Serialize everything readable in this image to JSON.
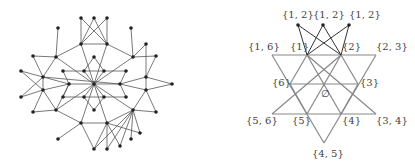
{
  "left_graph": {
    "nodes": [
      [
        81,
        18
      ],
      [
        94,
        18
      ],
      [
        107,
        18
      ],
      [
        58,
        28
      ],
      [
        131,
        28
      ],
      [
        81,
        44
      ],
      [
        107,
        44
      ],
      [
        146,
        44
      ],
      [
        33,
        56
      ],
      [
        56,
        57
      ],
      [
        94,
        57
      ],
      [
        133,
        57
      ],
      [
        156,
        56
      ],
      [
        21,
        71
      ],
      [
        63,
        71
      ],
      [
        84,
        71
      ],
      [
        104,
        71
      ],
      [
        126,
        71
      ],
      [
        43,
        77
      ],
      [
        146,
        77
      ],
      [
        69,
        84
      ],
      [
        94,
        84
      ],
      [
        120,
        84
      ],
      [
        172,
        84
      ],
      [
        43,
        90
      ],
      [
        146,
        90
      ],
      [
        21,
        97
      ],
      [
        63,
        97
      ],
      [
        84,
        97
      ],
      [
        104,
        97
      ],
      [
        126,
        97
      ],
      [
        94,
        110
      ],
      [
        33,
        112
      ],
      [
        56,
        110
      ],
      [
        133,
        110
      ],
      [
        156,
        112
      ],
      [
        81,
        123
      ],
      [
        107,
        123
      ],
      [
        140,
        133
      ],
      [
        58,
        139
      ],
      [
        131,
        139
      ],
      [
        94,
        149
      ],
      [
        107,
        149
      ],
      [
        120,
        146
      ]
    ],
    "edges": [
      [
        0,
        5
      ],
      [
        0,
        6
      ],
      [
        1,
        5
      ],
      [
        1,
        6
      ],
      [
        2,
        5
      ],
      [
        2,
        6
      ],
      [
        3,
        9
      ],
      [
        4,
        11
      ],
      [
        5,
        6
      ],
      [
        5,
        9
      ],
      [
        6,
        11
      ],
      [
        7,
        11
      ],
      [
        7,
        19
      ],
      [
        11,
        12
      ],
      [
        12,
        19
      ],
      [
        8,
        9
      ],
      [
        8,
        18
      ],
      [
        9,
        18
      ],
      [
        9,
        21
      ],
      [
        5,
        21
      ],
      [
        6,
        21
      ],
      [
        11,
        21
      ],
      [
        13,
        18
      ],
      [
        13,
        24
      ],
      [
        18,
        24
      ],
      [
        18,
        20
      ],
      [
        18,
        22
      ],
      [
        14,
        15
      ],
      [
        15,
        16
      ],
      [
        16,
        17
      ],
      [
        10,
        15
      ],
      [
        10,
        16
      ],
      [
        14,
        20
      ],
      [
        17,
        22
      ],
      [
        20,
        21
      ],
      [
        21,
        22
      ],
      [
        15,
        21
      ],
      [
        16,
        21
      ],
      [
        28,
        21
      ],
      [
        29,
        21
      ],
      [
        19,
        22
      ],
      [
        19,
        23
      ],
      [
        23,
        25
      ],
      [
        19,
        25
      ],
      [
        22,
        25
      ],
      [
        24,
        20
      ],
      [
        24,
        33
      ],
      [
        24,
        32
      ],
      [
        26,
        24
      ],
      [
        26,
        18
      ],
      [
        27,
        28
      ],
      [
        28,
        29
      ],
      [
        29,
        30
      ],
      [
        27,
        20
      ],
      [
        30,
        22
      ],
      [
        31,
        28
      ],
      [
        31,
        29
      ],
      [
        33,
        36
      ],
      [
        33,
        21
      ],
      [
        36,
        37
      ],
      [
        37,
        34
      ],
      [
        34,
        21
      ],
      [
        34,
        25
      ],
      [
        34,
        35
      ],
      [
        25,
        35
      ],
      [
        36,
        39
      ],
      [
        36,
        41
      ],
      [
        37,
        41
      ],
      [
        37,
        42
      ],
      [
        37,
        43
      ],
      [
        37,
        38
      ],
      [
        34,
        38
      ],
      [
        34,
        40
      ],
      [
        34,
        42
      ],
      [
        34,
        41
      ],
      [
        34,
        43
      ],
      [
        21,
        36
      ],
      [
        21,
        37
      ],
      [
        32,
        33
      ],
      [
        33,
        20
      ]
    ]
  },
  "right_diagram": {
    "points": {
      "top_left": [
        298,
        25
      ],
      "top_mid": [
        323,
        25
      ],
      "top_right": [
        349,
        25
      ],
      "s1": [
        307,
        55
      ],
      "s2": [
        341,
        55
      ],
      "s16": [
        272,
        55
      ],
      "s23": [
        376,
        55
      ],
      "s6": [
        290,
        84
      ],
      "empty": [
        324,
        84
      ],
      "s3": [
        358,
        84
      ],
      "s56": [
        272,
        114
      ],
      "s5": [
        307,
        114
      ],
      "s4": [
        341,
        114
      ],
      "s34": [
        376,
        114
      ],
      "s45": [
        324,
        143
      ]
    },
    "labels": [
      {
        "text": "{1, 2}",
        "x": 282,
        "y": 18
      },
      {
        "text": "{1, 2}",
        "x": 313,
        "y": 18
      },
      {
        "text": "{1, 2}",
        "x": 349,
        "y": 18
      },
      {
        "text": "{1, 6}",
        "x": 248,
        "y": 50
      },
      {
        "text": "{1}",
        "x": 290,
        "y": 50
      },
      {
        "text": "{2}",
        "x": 342,
        "y": 50
      },
      {
        "text": "{2, 3}",
        "x": 376,
        "y": 50
      },
      {
        "text": "{6}",
        "x": 272,
        "y": 86
      },
      {
        "text": "∅",
        "x": 321,
        "y": 97
      },
      {
        "text": "{3}",
        "x": 360,
        "y": 86
      },
      {
        "text": "{5, 6}",
        "x": 246,
        "y": 124
      },
      {
        "text": "{5}",
        "x": 292,
        "y": 124
      },
      {
        "text": "{4}",
        "x": 342,
        "y": 124
      },
      {
        "text": "{3, 4}",
        "x": 376,
        "y": 124
      },
      {
        "text": "{4, 5}",
        "x": 312,
        "y": 157
      }
    ]
  }
}
